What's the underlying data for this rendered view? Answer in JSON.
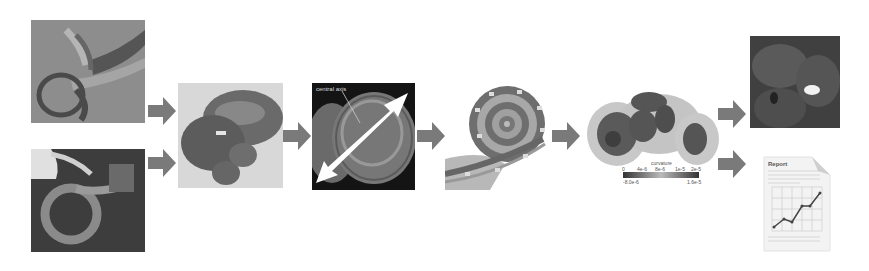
{
  "diagram": {
    "type": "pipeline-flow",
    "direction": "left-to-right",
    "arrow_color": "#7a7a7a",
    "stages": [
      {
        "id": "input-scan-1",
        "name": "Inner ear CT scan (rendering 1)"
      },
      {
        "id": "input-scan-2",
        "name": "Inner ear CT scan (rendering 2)"
      },
      {
        "id": "segmented-cochlea",
        "name": "Segmented cochlea 3D model"
      },
      {
        "id": "central-axis",
        "name": "Cochlea with central axis",
        "label": "central axis"
      },
      {
        "id": "unrolled-spiral",
        "name": "Cochlear spiral cross-section"
      },
      {
        "id": "heatmap",
        "name": "Surface heatmap with colorbar",
        "colorbar": {
          "title": "curvature",
          "ticks": [
            "0",
            "4e-6",
            "8e-6",
            "1e-5",
            "2e-5"
          ],
          "min_label": "-8.0e-6",
          "max_label": "1.6e-5"
        }
      },
      {
        "id": "output-visualization",
        "name": "3D visualization output"
      },
      {
        "id": "output-report",
        "name": "Report document",
        "title": "Report"
      }
    ],
    "edges": [
      [
        "input-scan-1",
        "segmented-cochlea"
      ],
      [
        "input-scan-2",
        "segmented-cochlea"
      ],
      [
        "segmented-cochlea",
        "central-axis"
      ],
      [
        "central-axis",
        "unrolled-spiral"
      ],
      [
        "unrolled-spiral",
        "heatmap"
      ],
      [
        "heatmap",
        "output-visualization"
      ],
      [
        "heatmap",
        "output-report"
      ]
    ]
  }
}
